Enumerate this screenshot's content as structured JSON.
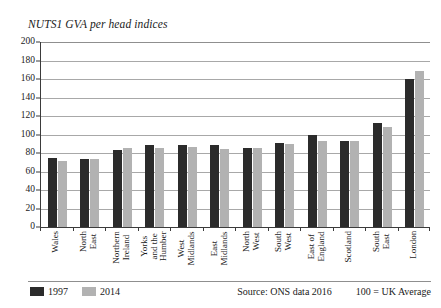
{
  "chart_data": {
    "type": "bar",
    "title": "NUTS1 GVA per head indices",
    "xlabel": "",
    "ylabel": "",
    "ylim": [
      0,
      200
    ],
    "ytick_step": 20,
    "yticks": [
      200,
      180,
      160,
      140,
      120,
      100,
      80,
      60,
      40,
      20,
      0
    ],
    "grid": true,
    "legend_position": "bottom-left",
    "categories": [
      "Wales",
      "North East",
      "Northern Ireland",
      "Yorks and the Humber",
      "West Midlands",
      "East Midlands",
      "North West",
      "South West",
      "East of England",
      "Scotland",
      "South East",
      "London"
    ],
    "category_lines": [
      [
        "Wales"
      ],
      [
        "North",
        "East"
      ],
      [
        "Northern",
        "Ireland"
      ],
      [
        "Yorks",
        "and the",
        "Humber"
      ],
      [
        "West",
        "Midlands"
      ],
      [
        "East",
        "Midlands"
      ],
      [
        "North",
        "West"
      ],
      [
        "South",
        "West"
      ],
      [
        "East of",
        "England"
      ],
      [
        "Scotland"
      ],
      [
        "South",
        "East"
      ],
      [
        "London"
      ]
    ],
    "series": [
      {
        "name": "1997",
        "color": "#2b2b2b",
        "values": [
          75,
          74,
          83,
          89,
          89,
          89,
          85,
          91,
          100,
          93,
          112,
          160
        ]
      },
      {
        "name": "2014",
        "color": "#b2b2b2",
        "values": [
          71,
          73,
          85,
          85,
          86,
          84,
          85,
          90,
          93,
          93,
          108,
          169
        ]
      }
    ],
    "annotations": {
      "source": "Source: ONS data 2016",
      "note": "100 = UK Average"
    }
  },
  "legend": {
    "items": [
      {
        "label": "1997"
      },
      {
        "label": "2014"
      }
    ]
  },
  "footer": {
    "source": "Source: ONS data 2016",
    "note": "100 = UK Average"
  }
}
